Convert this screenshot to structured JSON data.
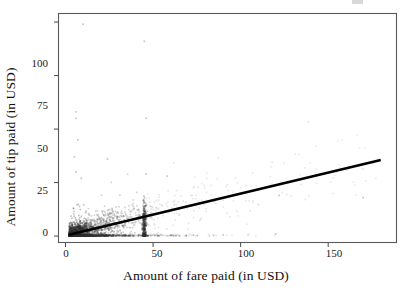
{
  "chart_data": {
    "type": "scatter",
    "title": "",
    "xlabel": "Amount of fare paid (in USD)",
    "ylabel": "Amount of tip paid (in USD)",
    "xlim": [
      -4,
      189
    ],
    "ylim": [
      -3,
      104
    ],
    "xticks": [
      0,
      50,
      100,
      150
    ],
    "xtick_labels": [
      "0",
      "50",
      "100",
      "150"
    ],
    "yticks": [
      0,
      25,
      50,
      75,
      100
    ],
    "ytick_labels": [
      "0",
      "25",
      "50",
      "75",
      "100"
    ],
    "grid": false,
    "legend": null,
    "panel_border": true,
    "point_color": "#333333",
    "point_opacity": 0.18,
    "point_size": 1.6,
    "line_color": "#000000",
    "line_width": 2.6,
    "series": [
      {
        "name": "taxi trips",
        "type": "scatter",
        "description": "Dense cloud of fare vs tip observations concentrated at low fares, with a vertical streak of flat-fare trips near fare = 45 and sparse high-tip outliers.",
        "n_points_drawn": 2600
      },
      {
        "name": "linear fit",
        "type": "line",
        "x": [
          2,
          180
        ],
        "y": [
          0.6,
          35.5
        ],
        "slope": 0.196,
        "intercept": 0.21
      }
    ],
    "outliers": [
      {
        "x": 10,
        "y": 99
      },
      {
        "x": 45,
        "y": 91
      },
      {
        "x": 46,
        "y": 55
      },
      {
        "x": 6,
        "y": 58
      },
      {
        "x": 6,
        "y": 55
      },
      {
        "x": 5,
        "y": 37
      },
      {
        "x": 24,
        "y": 36
      },
      {
        "x": 7,
        "y": 45
      },
      {
        "x": 6,
        "y": 30
      },
      {
        "x": 46,
        "y": 29
      },
      {
        "x": 58,
        "y": 28
      },
      {
        "x": 9,
        "y": 27
      },
      {
        "x": 122,
        "y": 19
      },
      {
        "x": 170,
        "y": 18
      },
      {
        "x": 120,
        "y": 1
      },
      {
        "x": 90,
        "y": 0.5
      }
    ]
  },
  "axes": {
    "x_title": "Amount of fare paid (in USD)",
    "y_title": "Amount of tip paid (in USD)"
  },
  "ticks": {
    "x": [
      "0",
      "50",
      "100",
      "150"
    ],
    "y": [
      "0",
      "25",
      "50",
      "75",
      "100"
    ]
  }
}
